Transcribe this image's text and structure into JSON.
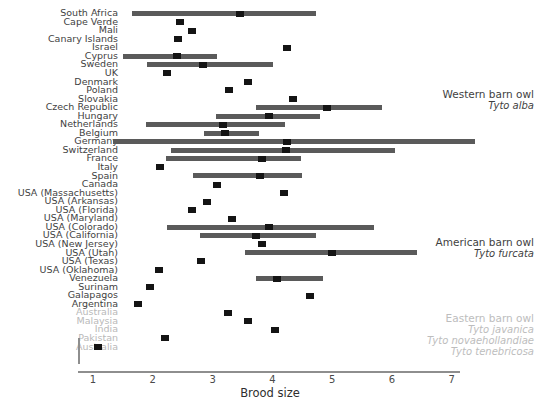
{
  "chart_data": {
    "type": "scatter",
    "title": "",
    "xlabel": "Brood size",
    "ylabel": "",
    "xlim": [
      0.7,
      7.4
    ],
    "xticks": [
      1,
      2,
      3,
      4,
      5,
      6,
      7
    ],
    "grid": false,
    "legend_position": "right-inline",
    "groups": [
      {
        "name": "Western barn owl",
        "scientific": "Tyto alba",
        "faded": false
      },
      {
        "name": "American barn owl",
        "scientific": "Tyto furcata",
        "faded": false
      },
      {
        "name": "Eastern barn owl",
        "scientific": "Tyto javanica",
        "scientific_extra": [
          "Tyto novaehollandiae",
          "Tyto tenebricosa"
        ],
        "faded": true
      }
    ],
    "categories": [
      "South Africa",
      "Cape Verde",
      "Mali",
      "Canary Islands",
      "Israel",
      "Cyprus",
      "Sweden",
      "UK",
      "Denmark",
      "Poland",
      "Slovakia",
      "Czech Republic",
      "Hungary",
      "Netherlands",
      "Belgium",
      "Germany",
      "Switzerland",
      "France",
      "Italy",
      "Spain",
      "Canada",
      "USA (Massachusetts)",
      "USA (Arkansas)",
      "USA (Florida)",
      "USA (Maryland)",
      "USA (Colorado)",
      "USA (California)",
      "USA (New Jersey)",
      "USA (Utah)",
      "USA (Texas)",
      "USA (Oklahoma)",
      "Venezuela",
      "Surinam",
      "Galapagos",
      "Argentina",
      "Australia",
      "Malaysia",
      "India",
      "Pakistan",
      "Australia"
    ],
    "points": [
      {
        "label": "South Africa",
        "value": 3.46,
        "ci": [
          1.65,
          4.73
        ],
        "group": 0,
        "faded": false
      },
      {
        "label": "Cape Verde",
        "value": 2.46,
        "ci": null,
        "group": 0,
        "faded": false
      },
      {
        "label": "Mali",
        "value": 2.66,
        "ci": null,
        "group": 0,
        "faded": false
      },
      {
        "label": "Canary Islands",
        "value": 2.42,
        "ci": null,
        "group": 0,
        "faded": false
      },
      {
        "label": "Israel",
        "value": 4.25,
        "ci": null,
        "group": 0,
        "faded": false
      },
      {
        "label": "Cyprus",
        "value": 2.41,
        "ci": [
          1.5,
          3.07
        ],
        "group": 0,
        "faded": false
      },
      {
        "label": "Sweden",
        "value": 2.84,
        "ci": [
          1.9,
          4.01
        ],
        "group": 0,
        "faded": false
      },
      {
        "label": "UK",
        "value": 2.23,
        "ci": null,
        "group": 0,
        "faded": false
      },
      {
        "label": "Denmark",
        "value": 3.6,
        "ci": null,
        "group": 0,
        "faded": false
      },
      {
        "label": "Poland",
        "value": 3.28,
        "ci": null,
        "group": 0,
        "faded": false
      },
      {
        "label": "Slovakia",
        "value": 4.35,
        "ci": null,
        "group": 0,
        "faded": false
      },
      {
        "label": "Czech Republic",
        "value": 4.91,
        "ci": [
          3.72,
          5.83
        ],
        "group": 0,
        "faded": false
      },
      {
        "label": "Hungary",
        "value": 3.95,
        "ci": [
          3.06,
          4.8
        ],
        "group": 0,
        "faded": false
      },
      {
        "label": "Netherlands",
        "value": 3.18,
        "ci": [
          1.89,
          4.21
        ],
        "group": 0,
        "faded": false
      },
      {
        "label": "Belgium",
        "value": 3.21,
        "ci": [
          2.85,
          3.78
        ],
        "group": 0,
        "faded": false
      },
      {
        "label": "Germany",
        "value": 4.25,
        "ci": [
          1.34,
          7.38
        ],
        "group": 0,
        "faded": false
      },
      {
        "label": "Switzerland",
        "value": 4.22,
        "ci": [
          2.3,
          6.05
        ],
        "group": 0,
        "faded": false
      },
      {
        "label": "France",
        "value": 3.82,
        "ci": [
          2.22,
          4.48
        ],
        "group": 0,
        "faded": false
      },
      {
        "label": "Italy",
        "value": 2.12,
        "ci": null,
        "group": 0,
        "faded": false
      },
      {
        "label": "Spain",
        "value": 3.79,
        "ci": [
          2.67,
          4.49
        ],
        "group": 0,
        "faded": false
      },
      {
        "label": "Canada",
        "value": 3.07,
        "ci": null,
        "group": 1,
        "faded": false
      },
      {
        "label": "USA (Massachusetts)",
        "value": 4.2,
        "ci": null,
        "group": 1,
        "faded": false
      },
      {
        "label": "USA (Arkansas)",
        "value": 2.9,
        "ci": null,
        "group": 1,
        "faded": false
      },
      {
        "label": "USA (Florida)",
        "value": 2.66,
        "ci": null,
        "group": 1,
        "faded": false
      },
      {
        "label": "USA (Maryland)",
        "value": 3.32,
        "ci": null,
        "group": 1,
        "faded": false
      },
      {
        "label": "USA (Colorado)",
        "value": 3.95,
        "ci": [
          2.24,
          5.7
        ],
        "group": 1,
        "faded": false
      },
      {
        "label": "USA (California)",
        "value": 3.73,
        "ci": [
          2.79,
          4.73
        ],
        "group": 1,
        "faded": false
      },
      {
        "label": "USA (New Jersey)",
        "value": 3.83,
        "ci": null,
        "group": 1,
        "faded": false
      },
      {
        "label": "USA (Utah)",
        "value": 5.0,
        "ci": [
          3.55,
          6.42
        ],
        "group": 1,
        "faded": false
      },
      {
        "label": "USA (Texas)",
        "value": 2.8,
        "ci": null,
        "group": 1,
        "faded": false
      },
      {
        "label": "USA (Oklahoma)",
        "value": 2.1,
        "ci": null,
        "group": 1,
        "faded": false
      },
      {
        "label": "Venezuela",
        "value": 4.08,
        "ci": [
          3.72,
          4.85
        ],
        "group": 1,
        "faded": false
      },
      {
        "label": "Surinam",
        "value": 1.95,
        "ci": null,
        "group": 1,
        "faded": false
      },
      {
        "label": "Galapagos",
        "value": 4.63,
        "ci": null,
        "group": 1,
        "faded": false
      },
      {
        "label": "Argentina",
        "value": 1.75,
        "ci": null,
        "group": 1,
        "faded": false
      },
      {
        "label": "Australia",
        "value": 3.25,
        "ci": null,
        "group": 2,
        "faded": true
      },
      {
        "label": "Malaysia",
        "value": 3.6,
        "ci": null,
        "group": 2,
        "faded": true
      },
      {
        "label": "India",
        "value": 4.05,
        "ci": null,
        "group": 2,
        "faded": true
      },
      {
        "label": "Pakistan",
        "value": 2.2,
        "ci": null,
        "group": 2,
        "faded": true
      },
      {
        "label": "Australia",
        "value": 1.08,
        "ci": null,
        "group": 2,
        "faded": true
      }
    ]
  },
  "colors": {
    "bar": "#5a5a5a",
    "point": "#141414",
    "axis": "#8e8e8e",
    "text": "#3f3f3f",
    "faded_text": "#bdbdbd"
  },
  "axis": {
    "title": "Brood size",
    "ticks": [
      "1",
      "2",
      "3",
      "4",
      "5",
      "6",
      "7"
    ]
  }
}
